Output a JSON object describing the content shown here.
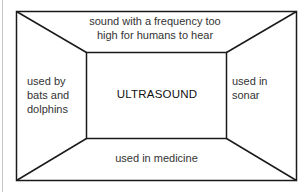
{
  "diagram": {
    "center": {
      "label": "ULTRASOUND"
    },
    "top": {
      "line1": "sound with a frequency too",
      "line2": "high for humans to hear"
    },
    "left": {
      "line1": "used by",
      "line2": "bats and",
      "line3": "dolphins"
    },
    "right": {
      "line1": "used in",
      "line2": "sonar"
    },
    "bottom": {
      "label": "used in medicine"
    },
    "colors": {
      "stroke": "#1a1a1a",
      "background": "#ffffff"
    }
  }
}
